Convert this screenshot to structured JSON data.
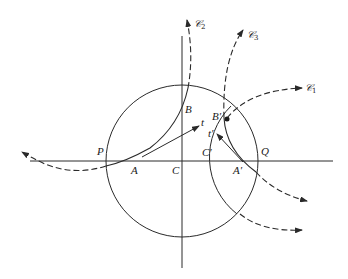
{
  "diagram": {
    "type": "geometric construction",
    "stroke_color": "#2a2a2a",
    "background": "#ffffff",
    "points": {
      "P": "P",
      "A": "A",
      "C": "C",
      "B": "B",
      "t": "t",
      "C_prime": "C′",
      "A_prime": "A′",
      "Q": "Q",
      "B_prime": "B′",
      "t_prime": "t′"
    },
    "curves": {
      "C1": {
        "symbol": "𝒞",
        "subscript": "1"
      },
      "C2": {
        "symbol": "𝒞",
        "subscript": "2"
      },
      "C3": {
        "symbol": "𝒞",
        "subscript": "3"
      }
    }
  }
}
